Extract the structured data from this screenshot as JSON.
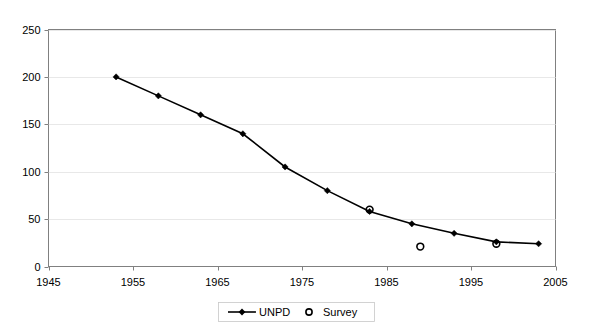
{
  "chart_data": {
    "type": "line",
    "title": "",
    "subtitle": "",
    "xlabel": "",
    "ylabel": "",
    "xlim": [
      1945,
      2005
    ],
    "ylim": [
      0,
      250
    ],
    "grid": true,
    "legend_position": "bottom",
    "x_ticks": [
      "1945",
      "1955",
      "1965",
      "1975",
      "1985",
      "1995",
      "2005"
    ],
    "x_tick_values": [
      1945,
      1955,
      1965,
      1975,
      1985,
      1995,
      2005
    ],
    "y_ticks": [
      "0",
      "50",
      "100",
      "150",
      "200",
      "250"
    ],
    "y_tick_values": [
      0,
      50,
      100,
      150,
      200,
      250
    ],
    "series": [
      {
        "name": "UNPD",
        "marker": "diamond",
        "line": true,
        "color": "#000000",
        "points": [
          {
            "x": 1953,
            "y": 200
          },
          {
            "x": 1958,
            "y": 180
          },
          {
            "x": 1963,
            "y": 160
          },
          {
            "x": 1968,
            "y": 140
          },
          {
            "x": 1973,
            "y": 105
          },
          {
            "x": 1978,
            "y": 80
          },
          {
            "x": 1983,
            "y": 58
          },
          {
            "x": 1988,
            "y": 45
          },
          {
            "x": 1993,
            "y": 35
          },
          {
            "x": 1998,
            "y": 26
          },
          {
            "x": 2003,
            "y": 24
          }
        ]
      },
      {
        "name": "Survey",
        "marker": "open-circle",
        "line": false,
        "color": "#000000",
        "points": [
          {
            "x": 1983,
            "y": 60
          },
          {
            "x": 1989,
            "y": 21
          },
          {
            "x": 1998,
            "y": 24
          }
        ]
      }
    ],
    "legend": [
      {
        "label": "UNPD",
        "marker": "line-diamond"
      },
      {
        "label": "Survey",
        "marker": "open-circle"
      }
    ]
  }
}
